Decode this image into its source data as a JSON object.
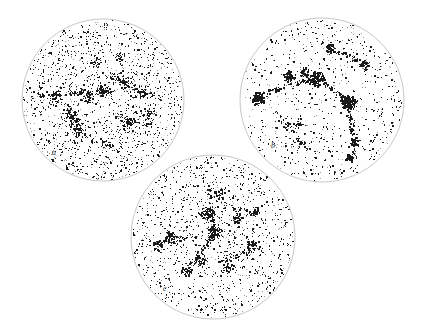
{
  "figure": {
    "kind": "three-panel-sky-distribution",
    "background_color": "#ffffff",
    "outline_color": "#b9b9b9",
    "point_color": "#1a1a1a",
    "faint_point_color": "#9a9a9a",
    "width": 424,
    "height": 331
  },
  "chart_data": {
    "type": "scatter",
    "title": "",
    "subtitle": "",
    "xlabel": "",
    "ylabel": "",
    "grid": false,
    "legend": "none",
    "projection": "equal-area circular sky projection",
    "panels": [
      {
        "label": "a",
        "label_x": 52,
        "label_y": 155,
        "center_x": 103,
        "center_y": 100,
        "radius": 81,
        "n_points": 2100,
        "point_size_min": 0.45,
        "point_size_max": 1.7,
        "density": "high-uniform",
        "description": "Dense, near-uniform speckle of faint points filling the whole disc with thin filamentary chains of darker points running diagonally across the upper-left and central regions.",
        "seed": 1701,
        "clusters": [
          {
            "x": 0.0,
            "y": 0.1,
            "r": 0.055,
            "n": 70,
            "weight": 1.0
          },
          {
            "x": -0.22,
            "y": 0.06,
            "r": 0.06,
            "n": 58,
            "weight": 0.9
          },
          {
            "x": -0.58,
            "y": 0.02,
            "r": 0.055,
            "n": 48,
            "weight": 0.8
          },
          {
            "x": -0.4,
            "y": -0.22,
            "r": 0.065,
            "n": 60,
            "weight": 0.95
          },
          {
            "x": -0.3,
            "y": -0.38,
            "r": 0.05,
            "n": 42,
            "weight": 0.8
          },
          {
            "x": 0.26,
            "y": 0.22,
            "r": 0.05,
            "n": 40,
            "weight": 0.75
          },
          {
            "x": 0.48,
            "y": 0.1,
            "r": 0.06,
            "n": 50,
            "weight": 0.85
          },
          {
            "x": 0.58,
            "y": -0.18,
            "r": 0.05,
            "n": 38,
            "weight": 0.7
          },
          {
            "x": 0.3,
            "y": -0.3,
            "r": 0.055,
            "n": 44,
            "weight": 0.8
          },
          {
            "x": 0.05,
            "y": -0.55,
            "r": 0.05,
            "n": 34,
            "weight": 0.7
          },
          {
            "x": -0.1,
            "y": 0.45,
            "r": 0.05,
            "n": 36,
            "weight": 0.7
          },
          {
            "x": 0.2,
            "y": 0.52,
            "r": 0.045,
            "n": 30,
            "weight": 0.65
          }
        ],
        "filaments": [
          {
            "x1": -0.8,
            "y1": 0.06,
            "x2": 0.05,
            "y2": 0.12,
            "n": 90,
            "spread": 0.035
          },
          {
            "x1": -0.45,
            "y1": -0.05,
            "x2": -0.22,
            "y2": -0.45,
            "n": 70,
            "spread": 0.035
          },
          {
            "x1": 0.1,
            "y1": 0.3,
            "x2": 0.62,
            "y2": 0.05,
            "n": 70,
            "spread": 0.035
          },
          {
            "x1": 0.15,
            "y1": -0.2,
            "x2": 0.62,
            "y2": -0.32,
            "n": 55,
            "spread": 0.035
          }
        ]
      },
      {
        "label": "b",
        "label_x": 271,
        "label_y": 148,
        "center_x": 322,
        "center_y": 100,
        "radius": 82,
        "n_points": 900,
        "point_size_min": 0.5,
        "point_size_max": 2.0,
        "density": "low-clumped",
        "description": "Sparse scattered points with several very dense solid-black clumps strung along an arc across the upper half, plus strong clumps at left edge and right-centre, and sparse filaments trailing toward the lower right.",
        "seed": 2027,
        "clusters": [
          {
            "x": -0.06,
            "y": 0.26,
            "r": 0.055,
            "n": 150,
            "weight": 2.2
          },
          {
            "x": 0.33,
            "y": -0.03,
            "r": 0.06,
            "n": 150,
            "weight": 2.2
          },
          {
            "x": -0.78,
            "y": 0.02,
            "r": 0.048,
            "n": 110,
            "weight": 2.0
          },
          {
            "x": -0.4,
            "y": 0.28,
            "r": 0.042,
            "n": 70,
            "weight": 1.6
          },
          {
            "x": -0.22,
            "y": 0.33,
            "r": 0.038,
            "n": 55,
            "weight": 1.4
          },
          {
            "x": 0.52,
            "y": 0.42,
            "r": 0.04,
            "n": 55,
            "weight": 1.5
          },
          {
            "x": 0.1,
            "y": 0.62,
            "r": 0.045,
            "n": 60,
            "weight": 1.5
          },
          {
            "x": 0.4,
            "y": -0.52,
            "r": 0.04,
            "n": 45,
            "weight": 1.3
          },
          {
            "x": 0.34,
            "y": -0.7,
            "r": 0.035,
            "n": 35,
            "weight": 1.2
          },
          {
            "x": -0.3,
            "y": -0.3,
            "r": 0.038,
            "n": 35,
            "weight": 1.1
          }
        ],
        "filaments": [
          {
            "x1": -0.8,
            "y1": 0.05,
            "x2": -0.06,
            "y2": 0.28,
            "n": 110,
            "spread": 0.03
          },
          {
            "x1": -0.06,
            "y1": 0.26,
            "x2": 0.34,
            "y2": -0.02,
            "n": 70,
            "spread": 0.03
          },
          {
            "x1": 0.34,
            "y1": -0.04,
            "x2": 0.4,
            "y2": -0.72,
            "n": 80,
            "spread": 0.03
          },
          {
            "x1": -0.56,
            "y1": -0.12,
            "x2": -0.16,
            "y2": -0.62,
            "n": 60,
            "spread": 0.035
          },
          {
            "x1": -0.02,
            "y1": 0.7,
            "x2": 0.45,
            "y2": 0.48,
            "n": 50,
            "spread": 0.035
          }
        ]
      },
      {
        "label": "c",
        "label_x": 163,
        "label_y": 291,
        "center_x": 213,
        "center_y": 237,
        "radius": 82,
        "n_points": 1550,
        "point_size_min": 0.45,
        "point_size_max": 1.8,
        "density": "medium-filamentary",
        "description": "Moderate speckle over the whole disc with a prominent dark filament running from upper-centre down through the middle to the lower-left, plus a distinct clump group at the left-centre and a broad scatter toward the lower right.",
        "seed": 3313,
        "clusters": [
          {
            "x": 0.02,
            "y": 0.06,
            "r": 0.055,
            "n": 85,
            "weight": 1.4
          },
          {
            "x": -0.08,
            "y": 0.28,
            "r": 0.05,
            "n": 70,
            "weight": 1.2
          },
          {
            "x": -0.52,
            "y": -0.02,
            "r": 0.055,
            "n": 70,
            "weight": 1.3
          },
          {
            "x": -0.66,
            "y": -0.1,
            "r": 0.042,
            "n": 45,
            "weight": 1.1
          },
          {
            "x": -0.14,
            "y": -0.28,
            "r": 0.05,
            "n": 60,
            "weight": 1.2
          },
          {
            "x": -0.32,
            "y": -0.42,
            "r": 0.048,
            "n": 50,
            "weight": 1.1
          },
          {
            "x": 0.18,
            "y": -0.38,
            "r": 0.045,
            "n": 48,
            "weight": 1.1
          },
          {
            "x": 0.3,
            "y": 0.22,
            "r": 0.045,
            "n": 42,
            "weight": 1.0
          },
          {
            "x": 0.46,
            "y": -0.1,
            "r": 0.045,
            "n": 40,
            "weight": 1.0
          },
          {
            "x": 0.08,
            "y": 0.52,
            "r": 0.045,
            "n": 40,
            "weight": 1.0
          },
          {
            "x": 0.52,
            "y": 0.3,
            "r": 0.04,
            "n": 32,
            "weight": 0.9
          }
        ],
        "filaments": [
          {
            "x1": -0.05,
            "y1": 0.62,
            "x2": 0.02,
            "y2": 0.04,
            "n": 85,
            "spread": 0.032
          },
          {
            "x1": 0.02,
            "y1": 0.04,
            "x2": -0.34,
            "y2": -0.44,
            "n": 85,
            "spread": 0.032
          },
          {
            "x1": -0.7,
            "y1": -0.08,
            "x2": -0.18,
            "y2": 0.02,
            "n": 60,
            "spread": 0.035
          },
          {
            "x1": 0.1,
            "y1": -0.3,
            "x2": 0.58,
            "y2": -0.12,
            "n": 55,
            "spread": 0.035
          },
          {
            "x1": 0.1,
            "y1": 0.4,
            "x2": 0.56,
            "y2": 0.26,
            "n": 45,
            "spread": 0.035
          }
        ]
      }
    ]
  }
}
